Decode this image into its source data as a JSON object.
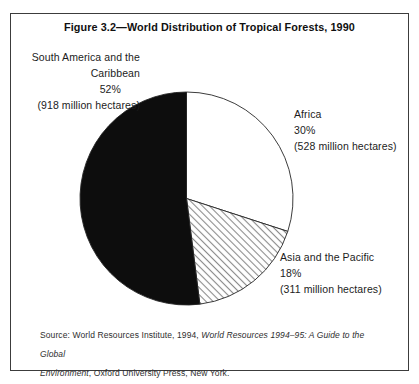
{
  "figure": {
    "title": "Figure 3.2—World Distribution of Tropical Forests, 1990"
  },
  "chart_data": {
    "type": "pie",
    "title": "Figure 3.2—World Distribution of Tropical Forests, 1990",
    "units": "percent of world tropical forest area, 1990",
    "start_angle_deg": 0,
    "direction": "clockwise",
    "legend": "none (direct labels around pie)",
    "slices": [
      {
        "label": "Africa",
        "pct": 30,
        "hectares_million": 528,
        "value_text": "(528 million hectares)",
        "fill": "white"
      },
      {
        "label": "Asia and the Pacific",
        "pct": 18,
        "hectares_million": 311,
        "value_text": "(311 million hectares)",
        "fill": "hatch"
      },
      {
        "label": "South America and the Caribbean",
        "pct": 52,
        "hectares_million": 918,
        "value_text": "(918 million hectares)",
        "fill": "black"
      }
    ]
  },
  "labels": {
    "south_america": {
      "lines": [
        "South America and the",
        "Caribbean",
        "52%",
        "(918 million hectares)"
      ]
    },
    "africa": {
      "lines": [
        "Africa",
        "30%",
        "(528 million hectares)"
      ]
    },
    "asia": {
      "lines": [
        "Asia and the Pacific",
        "18%",
        "(311 million hectares)"
      ]
    }
  },
  "source": {
    "lines": [
      {
        "parts": [
          {
            "text": "Source: World Resources Institute, 1994, ",
            "italic": false
          },
          {
            "text": "World Resources 1994–95: A Guide to the Global",
            "italic": true
          }
        ]
      },
      {
        "parts": [
          {
            "text": "Environment",
            "italic": true
          },
          {
            "text": ", Oxford University Press, New York.",
            "italic": false
          }
        ]
      }
    ]
  },
  "colors": {
    "slice_black": "#0d0d0d",
    "slice_white": "#ffffff",
    "hatch_line": "#8a8a8a",
    "outline": "#262626",
    "frame_border": "#3c3c3c",
    "text": "#1a1a1a"
  }
}
